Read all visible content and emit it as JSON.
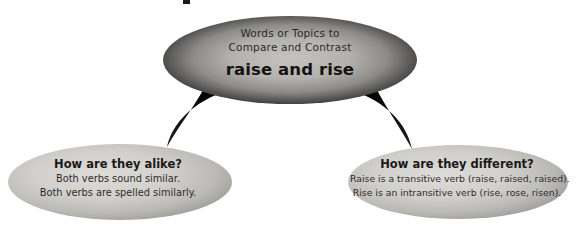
{
  "diagram": {
    "type": "compare-contrast-graphic-organizer",
    "background_color": "#ffffff",
    "connector_color": "#100f0e",
    "nodes": {
      "topic": {
        "label_line_1": "Words or Topics to",
        "label_line_2": "Compare and Contrast",
        "headline": "raise and rise",
        "shape": "ellipse",
        "fill_edge_color": "#171615",
        "fill_center_color": "#b9b7b4"
      },
      "alike": {
        "title": "How are they alike?",
        "line_1": "Both verbs sound similar.",
        "line_2": "Both verbs are spelled similarly.",
        "shape": "ellipse",
        "fill_edge_color": "#8e8d8a",
        "fill_center_color": "#d3d2cf"
      },
      "different": {
        "title": "How are they different?",
        "line_1": "Raise is a transitive verb (raise, raised, raised).",
        "line_2": "Rise is an intransitive verb (rise, rose, risen).",
        "shape": "ellipse",
        "fill_edge_color": "#8e8d8a",
        "fill_center_color": "#d3d2cf"
      }
    },
    "connectors": [
      {
        "name": "topic-to-alike",
        "from": "topic",
        "to": "alike"
      },
      {
        "name": "topic-to-different",
        "from": "topic",
        "to": "different"
      }
    ]
  }
}
